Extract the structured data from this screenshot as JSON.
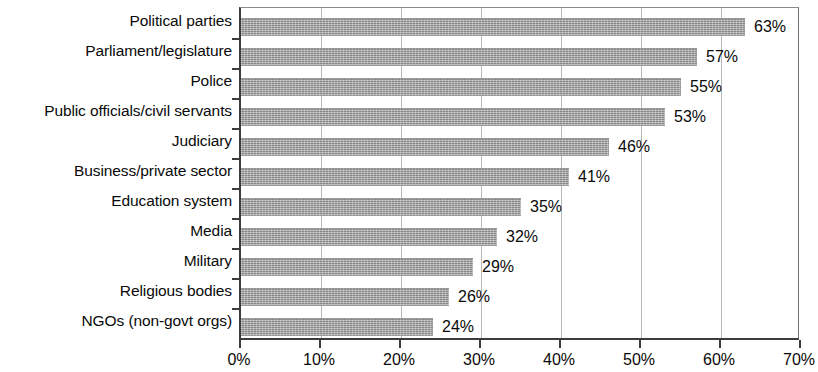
{
  "chart_data": {
    "type": "bar",
    "orientation": "horizontal",
    "title": "",
    "subtitle": "",
    "xlabel": "",
    "ylabel": "",
    "xlim": [
      0,
      70
    ],
    "ylim": null,
    "grid": true,
    "legend": null,
    "legend_position": "none",
    "value_label_suffix": "%",
    "categories": [
      "Political parties",
      "Parliament/legislature",
      "Police",
      "Public officials/civil servants",
      "Judiciary",
      "Business/private sector",
      "Education system",
      "Media",
      "Military",
      "Religious bodies",
      "NGOs (non-govt orgs)"
    ],
    "values": [
      63,
      57,
      55,
      53,
      46,
      41,
      35,
      32,
      29,
      26,
      24
    ],
    "value_labels": [
      "63%",
      "57%",
      "55%",
      "53%",
      "46%",
      "41%",
      "35%",
      "32%",
      "29%",
      "26%",
      "24%"
    ],
    "xticks": [
      0,
      10,
      20,
      30,
      40,
      50,
      60,
      70
    ],
    "xtick_labels": [
      "0%",
      "10%",
      "20%",
      "30%",
      "40%",
      "50%",
      "60%",
      "70%"
    ],
    "bar_color": "#a9a9a9",
    "axis_color": "#3c3c3c",
    "gridline_color": "#b9b9b9",
    "text_color": "#0a0a0a"
  }
}
